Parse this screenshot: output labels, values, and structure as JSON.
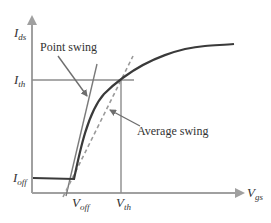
{
  "diagram": {
    "type": "transistor-transfer-characteristic",
    "labels": {
      "y_axis": {
        "main": "I",
        "sub": "ds"
      },
      "x_axis": {
        "main": "V",
        "sub": "gs"
      },
      "i_th": {
        "main": "I",
        "sub": "th"
      },
      "i_off": {
        "main": "I",
        "sub": "off"
      },
      "v_off": {
        "main": "V",
        "sub": "off"
      },
      "v_th": {
        "main": "V",
        "sub": "th"
      },
      "point_swing": "Point swing",
      "average_swing": "Average swing"
    },
    "colors": {
      "axis": "#a0a0a0",
      "curve": "#3a3a3a",
      "guide": "#8c8c8c",
      "dashed": "#9a9a9a",
      "text": "#333333"
    }
  }
}
